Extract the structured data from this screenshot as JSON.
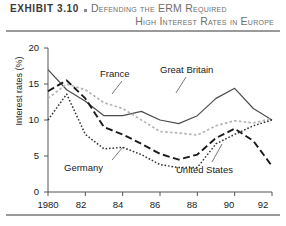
{
  "header": {
    "exhibit_label": "EXHIBIT 3.10",
    "bullet_icon": "square-bullet-icon",
    "title_line1": "Defending the ERM Required",
    "title_line2": "High Interest Rates in Europe"
  },
  "chart_data": {
    "type": "line",
    "title": "Defending the ERM Required High Interest Rates in Europe",
    "xlabel": "",
    "ylabel": "Interest rates (%)",
    "xlim": [
      1980,
      1992
    ],
    "ylim": [
      0,
      20
    ],
    "yticks": [
      0,
      5,
      10,
      15,
      20
    ],
    "ytick_labels": [
      "0",
      "5",
      "10",
      "15",
      "20"
    ],
    "xticks": [
      1980,
      1982,
      1984,
      1986,
      1988,
      1990,
      1992
    ],
    "xtick_labels": [
      "1980",
      "82",
      "84",
      "86",
      "88",
      "90",
      "92"
    ],
    "grid": false,
    "legend": "inline-annotations",
    "x": [
      1980,
      1981,
      1982,
      1983,
      1984,
      1985,
      1986,
      1987,
      1988,
      1989,
      1990,
      1991,
      1992
    ],
    "series": [
      {
        "name": "Great Britain",
        "style": "solid",
        "color": "#4d4d4d",
        "label_x": 1985.6,
        "label_y": 17.0,
        "values": [
          17.0,
          14.2,
          12.6,
          10.6,
          10.6,
          11.2,
          10.0,
          9.5,
          10.6,
          13.0,
          14.4,
          11.6,
          10.0
        ]
      },
      {
        "name": "France",
        "style": "dotted-light",
        "color": "#b5b5b5",
        "label_x": 1983.2,
        "label_y": 16.3,
        "values": [
          13.0,
          15.0,
          14.2,
          12.4,
          11.6,
          10.0,
          8.4,
          8.2,
          7.9,
          9.2,
          9.9,
          9.6,
          10.2
        ]
      },
      {
        "name": "Germany",
        "style": "dashed",
        "color": "#1a1a1a",
        "label_x": 1981.7,
        "label_y": 4.6,
        "values": [
          14.0,
          15.5,
          13.0,
          9.0,
          8.0,
          6.7,
          5.3,
          4.5,
          5.2,
          7.5,
          8.8,
          7.1,
          3.6
        ]
      },
      {
        "name": "United States",
        "style": "dotted-fine",
        "color": "#333333",
        "label_x": 1988.1,
        "label_y": 3.4,
        "values": [
          10.0,
          13.6,
          8.0,
          6.0,
          6.2,
          5.2,
          3.8,
          3.4,
          3.4,
          6.7,
          8.0,
          9.2,
          10.0
        ]
      }
    ],
    "annotations": [
      {
        "text": "France",
        "leader": true
      },
      {
        "text": "Great Britain",
        "leader": true
      },
      {
        "text": "Germany",
        "leader": true
      },
      {
        "text": "United States",
        "leader": true
      }
    ]
  }
}
